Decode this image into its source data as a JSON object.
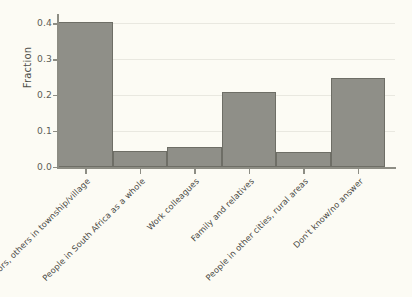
{
  "chart_data": {
    "type": "bar",
    "title": "",
    "subtitle": "",
    "xlabel": "",
    "ylabel": "Fraction",
    "categories": [
      "Neighbors, others in township/village",
      "People in South Africa as a whole",
      "Work colleagues",
      "Family and relatives",
      "People in other cities, rural areas",
      "Don't know/no answer"
    ],
    "values": [
      0.402,
      0.045,
      0.056,
      0.208,
      0.041,
      0.247
    ],
    "ylim": [
      0.0,
      0.42
    ],
    "yticks": [
      0.0,
      0.1,
      0.2,
      0.3,
      0.4
    ],
    "ytick_labels": [
      "0.0",
      "0.1",
      "0.2",
      "0.3",
      "0.4"
    ],
    "grid": true,
    "grid_axis": "y",
    "legend": false,
    "legend_position": "none",
    "bar_gap": 0,
    "colors": {
      "bar_fill": "#8f8f88",
      "bar_edge": "#6e6e66",
      "background": "#fbfaf2",
      "gridline": "#e9e8e0",
      "axis": "#8d8d84",
      "text": "#4a4a44"
    }
  }
}
